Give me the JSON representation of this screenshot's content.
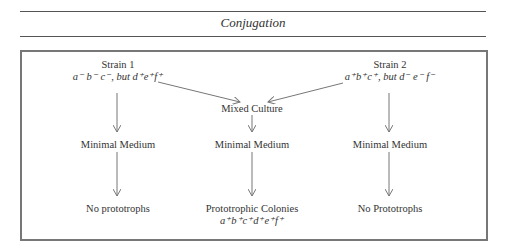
{
  "title": "Conjugation",
  "strain1": {
    "name": "Strain 1",
    "genotype": "a⁻ b⁻ c⁻, but d⁺e⁺f⁺"
  },
  "strain2": {
    "name": "Strain 2",
    "genotype": "a⁺b⁺c⁺, but  d⁻ e⁻ f⁻"
  },
  "center": {
    "mixed": "Mixed Culture",
    "medium": "Minimal Medium",
    "result": "Prototrophic Colonies",
    "result_genotype": "a⁺b⁺c⁺d⁺e⁺f⁺"
  },
  "left": {
    "medium": "Minimal Medium",
    "result": "No prototrophs"
  },
  "right": {
    "medium": "Minimal Medium",
    "result": "No Prototrophs"
  }
}
